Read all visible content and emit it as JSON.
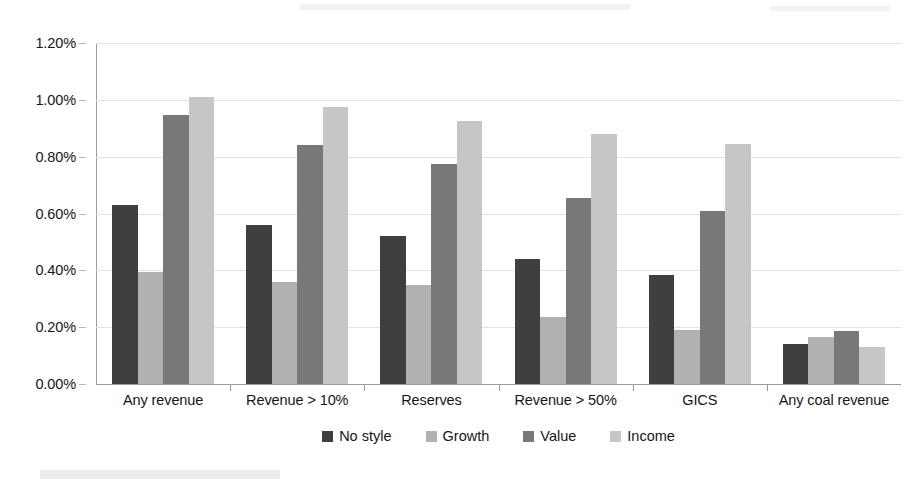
{
  "chart_data": {
    "type": "bar",
    "title": "",
    "subtitle": "",
    "xlabel": "",
    "ylabel": "",
    "ylim": [
      0,
      1.2
    ],
    "ytick_values": [
      1.2,
      1.0,
      0.8,
      0.6,
      0.4,
      0.2,
      0.0
    ],
    "ytick_labels": [
      "1.20%",
      "1.00%",
      "0.80%",
      "0.60%",
      "0.40%",
      "0.20%",
      "0.00%"
    ],
    "value_unit": "%",
    "grid": true,
    "legend_position": "bottom",
    "categories": [
      "Any revenue",
      "Revenue > 10%",
      "Reserves",
      "Revenue > 50%",
      "GICS",
      "Any coal revenue"
    ],
    "series": [
      {
        "name": "No style",
        "color": "#3f3f3f",
        "values": [
          0.63,
          0.56,
          0.52,
          0.44,
          0.385,
          0.14
        ]
      },
      {
        "name": "Growth",
        "color": "#b1b1b1",
        "values": [
          0.395,
          0.36,
          0.35,
          0.235,
          0.19,
          0.165
        ]
      },
      {
        "name": "Value",
        "color": "#787878",
        "values": [
          0.945,
          0.84,
          0.775,
          0.655,
          0.61,
          0.185
        ]
      },
      {
        "name": "Income",
        "color": "#c6c6c6",
        "values": [
          1.01,
          0.975,
          0.925,
          0.88,
          0.845,
          0.13
        ]
      }
    ]
  }
}
